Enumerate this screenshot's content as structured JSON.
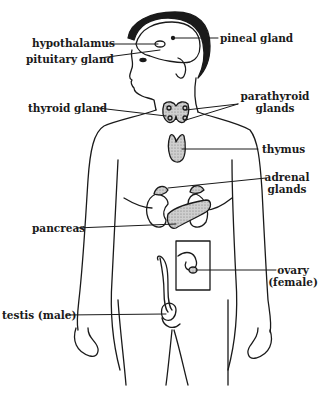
{
  "diagram": {
    "labels": {
      "hypothalamus": "hypothalamus",
      "pineal": "pineal gland",
      "pituitary": "pituitary gland",
      "thyroid": "thyroid gland",
      "parathyroid_1": "parathyroid",
      "parathyroid_2": "glands",
      "thymus": "thymus",
      "adrenal_1": "adrenal",
      "adrenal_2": "glands",
      "pancreas": "pancreas",
      "ovary_1": "ovary",
      "ovary_2": "(female)",
      "testis": "testis (male)"
    },
    "colors": {
      "ink": "#1a1a1a",
      "gland_fill": "#b8b8b8",
      "background": "#ffffff"
    }
  }
}
